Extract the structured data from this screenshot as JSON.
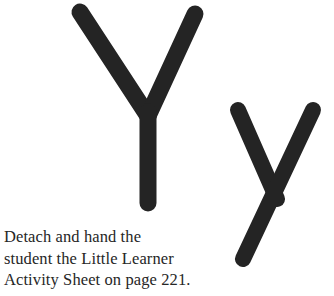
{
  "page": {
    "background_color": "#ffffff",
    "ink_color": "#262626"
  },
  "letters": {
    "uppercase": {
      "glyph": "Y",
      "name": "uppercase-letter-y",
      "stroke_color": "#242424",
      "stroke_width": 17
    },
    "lowercase": {
      "glyph": "y",
      "name": "lowercase-letter-y",
      "stroke_color": "#242424",
      "stroke_width": 16
    }
  },
  "instruction": {
    "full_text": "Detach and hand the student the Little Learner Activity Sheet on page 221.",
    "lines": [
      "Detach and hand the",
      "student the Little Learner",
      "Activity Sheet on page 221."
    ],
    "page_reference": "221"
  }
}
